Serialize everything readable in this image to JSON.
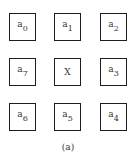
{
  "diagram": {
    "type": "3x3 neighborhood grid",
    "cells": [
      {
        "id": "a0",
        "base": "a",
        "sub": "0",
        "row": 0,
        "col": 0
      },
      {
        "id": "a1",
        "base": "a",
        "sub": "1",
        "row": 0,
        "col": 1
      },
      {
        "id": "a2",
        "base": "a",
        "sub": "2",
        "row": 0,
        "col": 2
      },
      {
        "id": "a7",
        "base": "a",
        "sub": "7",
        "row": 1,
        "col": 0
      },
      {
        "id": "X",
        "base": "X",
        "sub": "",
        "row": 1,
        "col": 1
      },
      {
        "id": "a3",
        "base": "a",
        "sub": "3",
        "row": 1,
        "col": 2
      },
      {
        "id": "a6",
        "base": "a",
        "sub": "6",
        "row": 2,
        "col": 0
      },
      {
        "id": "a5",
        "base": "a",
        "sub": "5",
        "row": 2,
        "col": 1
      },
      {
        "id": "a4",
        "base": "a",
        "sub": "4",
        "row": 2,
        "col": 2
      }
    ],
    "caption": "(a)",
    "colors": {
      "border": "#1e1e1e",
      "text": "#333333",
      "background": "#ffffff"
    }
  }
}
